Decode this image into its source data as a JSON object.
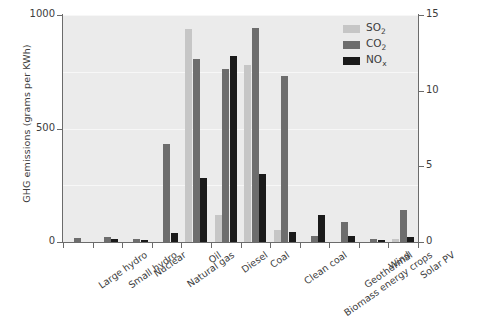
{
  "chart_data": {
    "type": "bar",
    "title": "",
    "subtitle": "",
    "xlabel": "",
    "ylabel": "GHG emissions (grams per KWh)",
    "ylabel_secondary": "NOx and SOx emissions (grams per KWh)",
    "ylim": [
      0,
      1000
    ],
    "ylim_secondary": [
      0,
      15
    ],
    "yticks": [
      0,
      500,
      1000
    ],
    "yticks_secondary": [
      0,
      5,
      10,
      15
    ],
    "ytick_labels": [
      "0",
      "500",
      "1000"
    ],
    "ytick_labels_secondary": [
      "0",
      "5",
      "10",
      "15"
    ],
    "grid": true,
    "legend_position": "top-right",
    "categories": [
      "Large hydro",
      "Small hydro",
      "Nuclear",
      "Natural gas",
      "Oil",
      "Diesel",
      "Coal",
      "Clean coal",
      "Biomass energy crops",
      "Geothermal",
      "Wind",
      "Solar PV"
    ],
    "series": [
      {
        "name": "SO2",
        "name_plain": "SO2",
        "axis": "right",
        "color": "#c6c6c6",
        "values": [
          0,
          0,
          0,
          0,
          940,
          120,
          780,
          55,
          0,
          0,
          0,
          15
        ],
        "values_secondary_units": [
          0,
          0,
          0,
          0,
          14.1,
          1.8,
          11.7,
          0.8,
          0,
          0,
          0,
          0.22
        ]
      },
      {
        "name": "CO2",
        "name_plain": "CO2",
        "axis": "left",
        "color": "#6d6d6d",
        "values": [
          18,
          22,
          12,
          430,
          805,
          760,
          945,
          730,
          25,
          90,
          12,
          140
        ],
        "values_secondary_units": []
      },
      {
        "name": "NOx",
        "name_plain": "NOx",
        "axis": "right",
        "color": "#1a1a1a",
        "values": [
          0,
          14,
          8,
          40,
          280,
          820,
          300,
          45,
          120,
          25,
          10,
          20
        ],
        "values_secondary_units": [
          0,
          0.21,
          0.12,
          0.6,
          4.2,
          12.3,
          4.5,
          0.68,
          1.8,
          0.38,
          0.15,
          0.3
        ]
      }
    ]
  },
  "legend": {
    "items": [
      {
        "label_main": "SO",
        "label_sub": "2",
        "key": "so2"
      },
      {
        "label_main": "CO",
        "label_sub": "2",
        "key": "co2"
      },
      {
        "label_main": "NO",
        "label_sub": "x",
        "key": "nox"
      }
    ]
  }
}
